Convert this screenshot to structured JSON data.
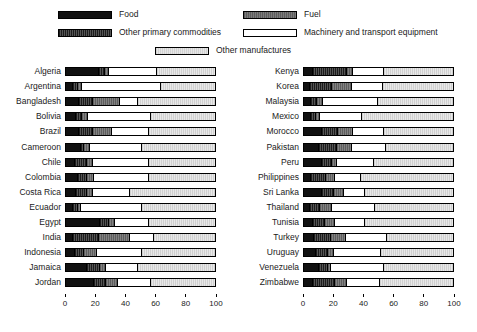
{
  "legend": {
    "entries": [
      {
        "key": "food",
        "label": "Food",
        "swatch": "sw-food"
      },
      {
        "key": "fuel",
        "label": "Fuel",
        "swatch": "sw-fuel"
      },
      {
        "key": "other_primary",
        "label": "Other primary commodities",
        "swatch": "sw-other-primary"
      },
      {
        "key": "machinery",
        "label": "Machinery and transport equipment",
        "swatch": "sw-machinery"
      },
      {
        "key": "other_manu",
        "label": "Other manufactures",
        "swatch": "sw-other-manu"
      }
    ]
  },
  "colors": {
    "food": "#111111",
    "other_primary": "#3a3a3a",
    "fuel": "#6e6e6e",
    "machinery": "#ffffff",
    "other_manufactures": "#dcdcdc",
    "outline": "#000000",
    "background": "#ffffff"
  },
  "axis": {
    "ticks": [
      0,
      20,
      40,
      60,
      80,
      100
    ],
    "min": 0,
    "max": 100
  },
  "chart_data": {
    "type": "bar",
    "subtype": "stacked-horizontal-100pct",
    "title": "",
    "xlabel": "",
    "ylabel": "",
    "xlim": [
      0,
      100
    ],
    "grid": false,
    "legend_position": "top",
    "series": [
      {
        "name": "Food",
        "key": "food"
      },
      {
        "name": "Other primary commodities",
        "key": "other_primary"
      },
      {
        "name": "Fuel",
        "key": "fuel"
      },
      {
        "name": "Machinery and transport equipment",
        "key": "machinery"
      },
      {
        "name": "Other manufactures",
        "key": "other_manufactures"
      }
    ],
    "panels": [
      {
        "id": "left",
        "categories": [
          "Algeria",
          "Argentina",
          "Bangladesh",
          "Bolivia",
          "Brazil",
          "Cameroon",
          "Chile",
          "Colombia",
          "Costa Rica",
          "Ecuador",
          "Egypt",
          "India",
          "Indonesia",
          "Jamaica",
          "Jordan"
        ],
        "rows": [
          {
            "category": "Algeria",
            "values": {
              "food": 22,
              "other_primary": 4,
              "fuel": 3,
              "machinery": 32,
              "other_manufactures": 39
            }
          },
          {
            "category": "Argentina",
            "values": {
              "food": 5,
              "other_primary": 3,
              "fuel": 3,
              "machinery": 53,
              "other_manufactures": 36
            }
          },
          {
            "category": "Bangladesh",
            "values": {
              "food": 9,
              "other_primary": 9,
              "fuel": 18,
              "machinery": 12,
              "other_manufactures": 52
            }
          },
          {
            "category": "Bolivia",
            "values": {
              "food": 7,
              "other_primary": 4,
              "fuel": 4,
              "machinery": 42,
              "other_manufactures": 43
            }
          },
          {
            "category": "Brazil",
            "values": {
              "food": 9,
              "other_primary": 9,
              "fuel": 13,
              "machinery": 25,
              "other_manufactures": 44
            }
          },
          {
            "category": "Cameroon",
            "values": {
              "food": 10,
              "other_primary": 2,
              "fuel": 4,
              "machinery": 35,
              "other_manufactures": 49
            }
          },
          {
            "category": "Chile",
            "values": {
              "food": 6,
              "other_primary": 8,
              "fuel": 4,
              "machinery": 38,
              "other_manufactures": 44
            }
          },
          {
            "category": "Colombia",
            "values": {
              "food": 8,
              "other_primary": 6,
              "fuel": 5,
              "machinery": 37,
              "other_manufactures": 44
            }
          },
          {
            "category": "Costa Rica",
            "values": {
              "food": 7,
              "other_primary": 7,
              "fuel": 4,
              "machinery": 25,
              "other_manufactures": 57
            }
          },
          {
            "category": "Ecuador",
            "values": {
              "food": 5,
              "other_primary": 3,
              "fuel": 2,
              "machinery": 41,
              "other_manufactures": 49
            }
          },
          {
            "category": "Egypt",
            "values": {
              "food": 23,
              "other_primary": 6,
              "fuel": 4,
              "machinery": 23,
              "other_manufactures": 44
            }
          },
          {
            "category": "India",
            "values": {
              "food": 5,
              "other_primary": 17,
              "fuel": 21,
              "machinery": 16,
              "other_manufactures": 41
            }
          },
          {
            "category": "Indonesia",
            "values": {
              "food": 6,
              "other_primary": 6,
              "fuel": 9,
              "machinery": 30,
              "other_manufactures": 49
            }
          },
          {
            "category": "Jamaica",
            "values": {
              "food": 14,
              "other_primary": 9,
              "fuel": 4,
              "machinery": 21,
              "other_manufactures": 52
            }
          },
          {
            "category": "Jordan",
            "values": {
              "food": 19,
              "other_primary": 8,
              "fuel": 8,
              "machinery": 22,
              "other_manufactures": 43
            }
          }
        ]
      },
      {
        "id": "right",
        "categories": [
          "Kenya",
          "Korea",
          "Malaysia",
          "Mexico",
          "Morocco",
          "Pakistan",
          "Peru",
          "Philippines",
          "Sri Lanka",
          "Thailand",
          "Tunisia",
          "Turkey",
          "Uruguay",
          "Venezuela",
          "Zimbabwe"
        ],
        "rows": [
          {
            "category": "Kenya",
            "values": {
              "food": 6,
              "other_primary": 23,
              "fuel": 4,
              "machinery": 21,
              "other_manufactures": 46
            }
          },
          {
            "category": "Korea",
            "values": {
              "food": 4,
              "other_primary": 15,
              "fuel": 13,
              "machinery": 21,
              "other_manufactures": 47
            }
          },
          {
            "category": "Malaysia",
            "values": {
              "food": 5,
              "other_primary": 4,
              "fuel": 4,
              "machinery": 37,
              "other_manufactures": 50
            }
          },
          {
            "category": "Mexico",
            "values": {
              "food": 5,
              "other_primary": 3,
              "fuel": 3,
              "machinery": 28,
              "other_manufactures": 61
            }
          },
          {
            "category": "Morocco",
            "values": {
              "food": 12,
              "other_primary": 11,
              "fuel": 10,
              "machinery": 21,
              "other_manufactures": 46
            }
          },
          {
            "category": "Pakistan",
            "values": {
              "food": 10,
              "other_primary": 12,
              "fuel": 10,
              "machinery": 23,
              "other_manufactures": 45
            }
          },
          {
            "category": "Peru",
            "values": {
              "food": 12,
              "other_primary": 7,
              "fuel": 3,
              "machinery": 25,
              "other_manufactures": 53
            }
          },
          {
            "category": "Philippines",
            "values": {
              "food": 5,
              "other_primary": 10,
              "fuel": 6,
              "machinery": 17,
              "other_manufactures": 62
            }
          },
          {
            "category": "Sri Lanka",
            "values": {
              "food": 12,
              "other_primary": 8,
              "fuel": 7,
              "machinery": 14,
              "other_manufactures": 59
            }
          },
          {
            "category": "Thailand",
            "values": {
              "food": 4,
              "other_primary": 7,
              "fuel": 8,
              "machinery": 29,
              "other_manufactures": 52
            }
          },
          {
            "category": "Tunisia",
            "values": {
              "food": 6,
              "other_primary": 8,
              "fuel": 7,
              "machinery": 20,
              "other_manufactures": 59
            }
          },
          {
            "category": "Turkey",
            "values": {
              "food": 7,
              "other_primary": 11,
              "fuel": 10,
              "machinery": 28,
              "other_manufactures": 44
            }
          },
          {
            "category": "Uruguay",
            "values": {
              "food": 8,
              "other_primary": 8,
              "fuel": 4,
              "machinery": 32,
              "other_manufactures": 48
            }
          },
          {
            "category": "Venezuela",
            "values": {
              "food": 10,
              "other_primary": 6,
              "fuel": 2,
              "machinery": 36,
              "other_manufactures": 46
            }
          },
          {
            "category": "Zimbabwe",
            "values": {
              "food": 6,
              "other_primary": 15,
              "fuel": 8,
              "machinery": 22,
              "other_manufactures": 49
            }
          }
        ]
      }
    ]
  }
}
